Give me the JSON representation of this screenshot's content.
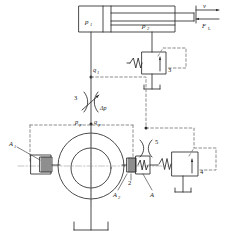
{
  "diagram": {
    "type": "hydraulic-schematic",
    "colors": {
      "line": "#2a2a2a",
      "dashed": "#7a7a7a",
      "background": "#ffffff",
      "centerline": "#8a8a8a"
    }
  },
  "labels": {
    "p1": "p",
    "p1_sub": "1",
    "p2": "p",
    "p2_sub": "2",
    "velocity": "v",
    "load_force": "F",
    "load_force_sub": "L",
    "q1": "q",
    "q1_sub": "1",
    "qp": "q",
    "qp_sub": "p",
    "pp": "p",
    "pp_sub": "p",
    "delta_p": "Δp",
    "orifice3": "3",
    "relief3": "3",
    "orifice5": "5",
    "valve4": "4",
    "piston2": "2",
    "area_A1": "A",
    "area_A1_sub": "1",
    "area_A2": "A",
    "area_A2_sub": "2",
    "area_A": "A"
  },
  "components": [
    {
      "id": "cylinder",
      "name": "hydraulic-cylinder",
      "label": "p1 / p2"
    },
    {
      "id": "relief-valve-3",
      "name": "pressure-relief-valve",
      "label": "3"
    },
    {
      "id": "orifice-3",
      "name": "variable-orifice",
      "label": "3"
    },
    {
      "id": "pump",
      "name": "variable-displacement-pump",
      "label": ""
    },
    {
      "id": "control-piston-1",
      "name": "large-control-piston",
      "label": "A1"
    },
    {
      "id": "control-piston-2",
      "name": "small-control-piston",
      "label": "2 / A2 / A"
    },
    {
      "id": "orifice-5",
      "name": "fixed-orifice",
      "label": "5"
    },
    {
      "id": "valve-4",
      "name": "pressure-compensator-valve",
      "label": "4"
    },
    {
      "id": "tank-main",
      "name": "reservoir",
      "label": ""
    },
    {
      "id": "tank-relief",
      "name": "reservoir",
      "label": ""
    },
    {
      "id": "tank-valve4",
      "name": "reservoir",
      "label": ""
    }
  ]
}
